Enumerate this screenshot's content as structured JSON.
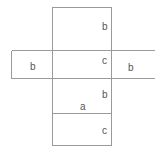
{
  "figure": {
    "type": "geometry-net",
    "canvas": {
      "width": 161,
      "height": 154
    },
    "colors": {
      "background": "#ffffff",
      "stroke": "#9a9a9a",
      "label_text": "#555555"
    },
    "shapes": {
      "vertical_rectangle": {
        "name": "vertical-strip",
        "x": 52,
        "y": 7,
        "width": 60,
        "height": 139
      },
      "horizontal_rectangle": {
        "name": "horizontal-strip",
        "x": 11,
        "y": 50,
        "width": 144,
        "height": 28,
        "right_edge_open": true
      },
      "divider_line": {
        "name": "lower-horizontal-divider",
        "x1": 52,
        "y1": 113,
        "x2": 112,
        "y2": 113
      }
    },
    "labels": [
      {
        "id": "label-top-b",
        "text": "b",
        "x": 102,
        "y": 22,
        "region": "top-face-height"
      },
      {
        "id": "label-center-c",
        "text": "c",
        "x": 102,
        "y": 56,
        "region": "center-face-height"
      },
      {
        "id": "label-left-b",
        "text": "b",
        "x": 30,
        "y": 62,
        "region": "left-flap-width"
      },
      {
        "id": "label-right-b",
        "text": "b",
        "x": 128,
        "y": 63,
        "region": "right-flap-width"
      },
      {
        "id": "label-middle-b",
        "text": "b",
        "x": 102,
        "y": 90,
        "region": "lower-face-height"
      },
      {
        "id": "label-a",
        "text": "a",
        "x": 80,
        "y": 102,
        "region": "face-width"
      },
      {
        "id": "label-bottom-c",
        "text": "c",
        "x": 102,
        "y": 126,
        "region": "bottom-face-height"
      }
    ]
  }
}
